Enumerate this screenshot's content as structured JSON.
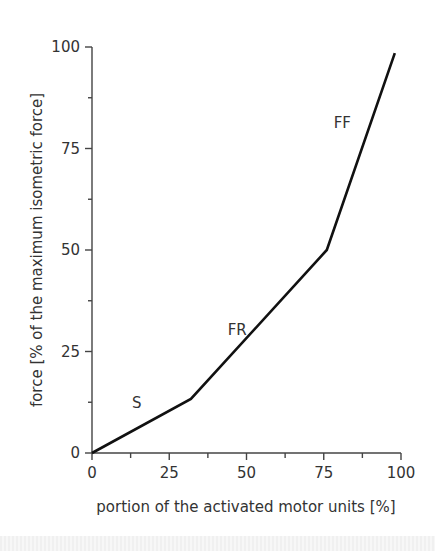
{
  "chart_data": {
    "type": "line",
    "title": "",
    "xlabel": "portion of the activated motor units [%]",
    "ylabel": "force [% of the maximum isometric force]",
    "xlim": [
      0,
      100
    ],
    "ylim": [
      0,
      100
    ],
    "x_ticks": [
      0,
      25,
      50,
      75,
      100
    ],
    "y_ticks": [
      0,
      25,
      50,
      75,
      100
    ],
    "x_minor_ticks": [
      12.5,
      37.5,
      62.5,
      87.5
    ],
    "y_minor_ticks": [
      12.5,
      37.5,
      62.5,
      87.5
    ],
    "grid": false,
    "legend": null,
    "series": [
      {
        "name": "force recruitment curve",
        "x": [
          0,
          32,
          76,
          98
        ],
        "y": [
          0,
          13.3,
          50,
          98.5
        ]
      }
    ],
    "annotations": [
      {
        "text": "S",
        "x": 14.5,
        "y": 11
      },
      {
        "text": "FR",
        "x": 47,
        "y": 29
      },
      {
        "text": "FF",
        "x": 81,
        "y": 80
      }
    ]
  }
}
